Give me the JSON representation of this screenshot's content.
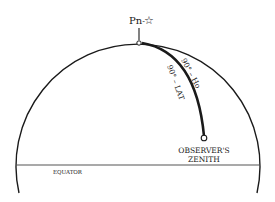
{
  "diagram": {
    "type": "celestial-sphere",
    "labels": {
      "pole": "Pn",
      "pole_separator": "-",
      "pole_star_icon": "☆",
      "arc_outer": "90° – Ho",
      "arc_inner": "90° – LAT",
      "zenith_line1": "OBSERVER'S",
      "zenith_line2": "ZENITH",
      "equator": "EQUATOR"
    },
    "colors": {
      "stroke": "#1a1a1a",
      "equator_line": "#555555",
      "background": "#ffffff"
    }
  }
}
